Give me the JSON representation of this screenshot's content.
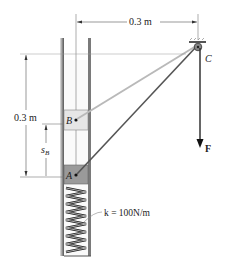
{
  "diagram": {
    "dimensions": {
      "top_horizontal": "0.3 m",
      "left_vertical": "0.3 m",
      "sB_symbol": "s",
      "sB_subscript": "B"
    },
    "points": {
      "A": "A",
      "B": "B",
      "C": "C"
    },
    "force": {
      "label": "F"
    },
    "spring": {
      "label": "k = 100N/m"
    },
    "colors": {
      "tube_wall": "#6f6f6f",
      "block_B_fill": "#e6e6e6",
      "block_A_fill": "#9a9a9a",
      "cord_B": "#b9b9b9",
      "cord_A": "#555555",
      "force_arrow": "#333333"
    }
  }
}
